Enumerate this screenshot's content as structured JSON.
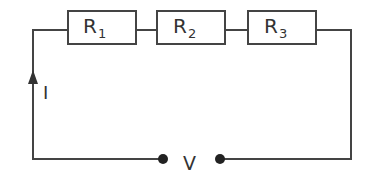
{
  "diagram": {
    "type": "series-circuit",
    "resistors": [
      {
        "symbol": "R",
        "subscript": "1"
      },
      {
        "symbol": "R",
        "subscript": "2"
      },
      {
        "symbol": "R",
        "subscript": "3"
      }
    ],
    "current_label": "I",
    "voltage_label": "V",
    "colors": {
      "wire": "#444444",
      "text": "#333333",
      "background": "#ffffff"
    }
  }
}
